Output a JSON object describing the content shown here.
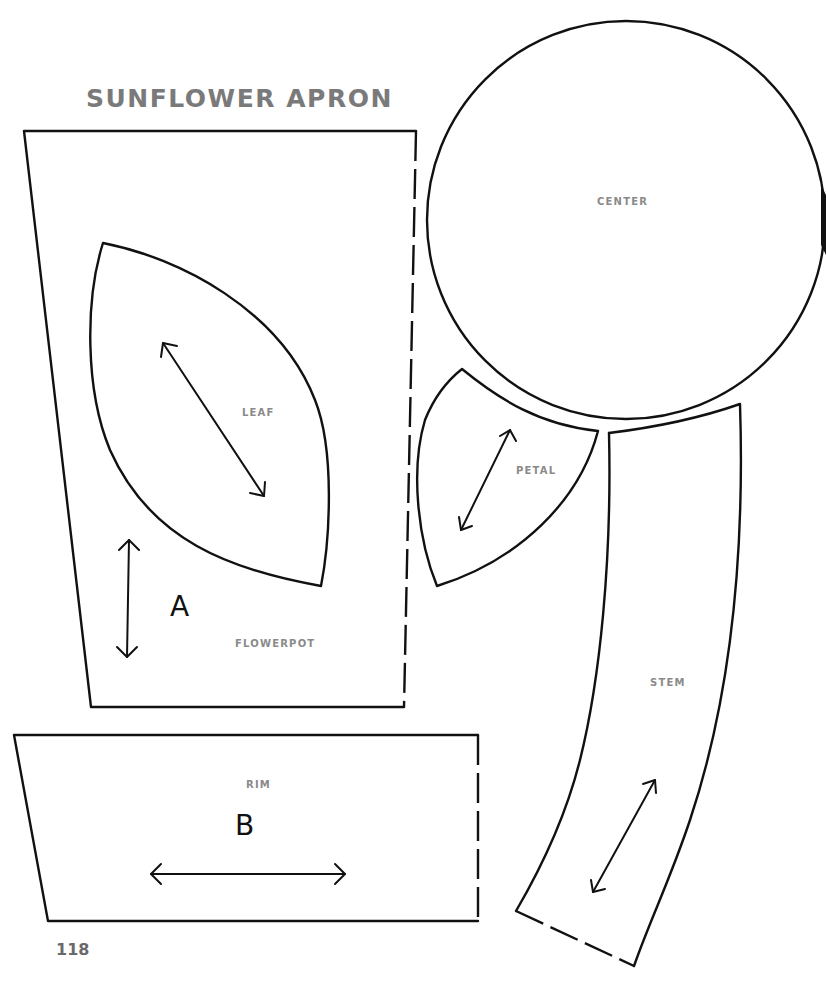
{
  "document": {
    "title": "SUNFLOWER APRON",
    "page_number": "118"
  },
  "pieces": {
    "flowerpot": {
      "label": "FLOWERPOT",
      "letter": "A"
    },
    "leaf": {
      "label": "LEAF"
    },
    "center": {
      "label": "CENTER"
    },
    "petal": {
      "label": "PETAL"
    },
    "stem": {
      "label": "STEM"
    },
    "rim": {
      "label": "RIM",
      "letter": "B"
    }
  },
  "icons": {
    "grainline": "double-headed-arrow",
    "fold_line": "dashed-edge"
  },
  "colors": {
    "outline": "#111111",
    "label_gray": "#8a8a8a",
    "title_gray": "#7a7a7a",
    "background": "#ffffff"
  }
}
